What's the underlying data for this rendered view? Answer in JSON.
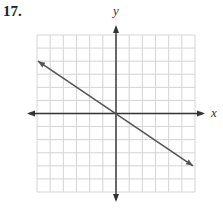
{
  "problem": {
    "number_label": "17."
  },
  "chart_data": {
    "type": "line",
    "title": "17.",
    "xlabel": "x",
    "ylabel": "y",
    "xlim": [
      -6,
      6
    ],
    "ylim": [
      -6,
      6
    ],
    "grid": true,
    "grid_step": 1,
    "tick_labels": false,
    "legend": null,
    "series": [
      {
        "name": "line",
        "equation": "y = -2/3 x",
        "slope": -0.6667,
        "intercept": 0,
        "x": [
          -6,
          -3,
          0,
          3,
          6
        ],
        "y": [
          4,
          2,
          0,
          -2,
          -4
        ],
        "arrows_both_ends": true
      }
    ],
    "colors": {
      "grid": "#d4d4d4",
      "axes": "#333333",
      "line": "#555555"
    }
  }
}
